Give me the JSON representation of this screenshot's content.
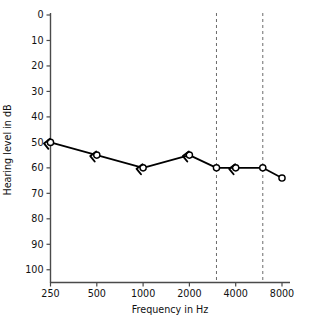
{
  "chart_data": {
    "type": "line",
    "title": "",
    "xlabel": "Frequency in Hz",
    "ylabel": "Hearing level in dB",
    "x_scale": "log2",
    "x_tick_labels": [
      "250",
      "500",
      "1000",
      "2000",
      "4000",
      "8000"
    ],
    "x_tick_values": [
      250,
      500,
      1000,
      2000,
      4000,
      8000
    ],
    "y_tick_labels": [
      "0",
      "10",
      "20",
      "30",
      "40",
      "50",
      "60",
      "70",
      "80",
      "90",
      "100"
    ],
    "y_tick_values": [
      0,
      10,
      20,
      30,
      40,
      50,
      60,
      70,
      80,
      90,
      100
    ],
    "ylim": [
      0,
      105
    ],
    "y_axis_inverted": true,
    "xlim": [
      250,
      8000
    ],
    "grid": false,
    "legend": "none",
    "reference_lines": [
      {
        "name": "3000-hz-reference",
        "value": 3000,
        "style": "dashed"
      },
      {
        "name": "6000-hz-reference",
        "value": 6000,
        "style": "dashed"
      }
    ],
    "series": [
      {
        "name": "Right ear air conduction (masked)",
        "marker": "circle-open",
        "x": [
          250,
          500,
          1000,
          2000,
          3000,
          4000,
          6000,
          8000
        ],
        "values": [
          50,
          55,
          60,
          55,
          60,
          60,
          60,
          64
        ],
        "masking_markers": [
          {
            "x": 250,
            "y": 50,
            "glyph": "left-arrow"
          },
          {
            "x": 500,
            "y": 55,
            "glyph": "left-arrow"
          },
          {
            "x": 1000,
            "y": 60,
            "glyph": "left-arrow"
          },
          {
            "x": 2000,
            "y": 55,
            "glyph": "left-arrow"
          },
          {
            "x": 4000,
            "y": 60,
            "glyph": "left-arrow"
          }
        ]
      }
    ],
    "colors": {
      "axis": "#4a4a4a",
      "series": "#000000",
      "marker_fill": "#ffffff",
      "reference_line": "#5a5a5a",
      "background": "#ffffff",
      "text": "#111111"
    }
  }
}
